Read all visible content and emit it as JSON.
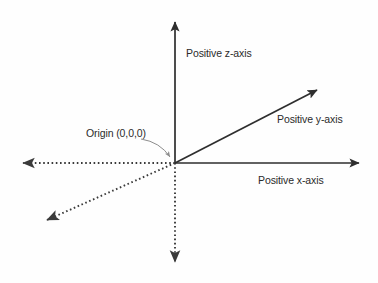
{
  "diagram": {
    "background_color": "#fefefe",
    "solid_axis_color": "#2e2e2e",
    "dotted_axis_color": "#3a3a3a",
    "text_color": "#2b2b2b",
    "origin": {
      "x": 175,
      "y": 163
    },
    "labels": {
      "z_axis": "Positive z-axis",
      "y_axis": "Positive y-axis",
      "x_axis": "Positive x-axis",
      "origin": "Origin (0,0,0)"
    },
    "axes": [
      {
        "name": "positive-z-axis",
        "style": "solid",
        "from": {
          "x": 175,
          "y": 163
        },
        "to": {
          "x": 175,
          "y": 17
        },
        "arrowhead": true
      },
      {
        "name": "negative-z-axis",
        "style": "dotted",
        "from": {
          "x": 175,
          "y": 163
        },
        "to": {
          "x": 175,
          "y": 268
        },
        "arrowhead": true
      },
      {
        "name": "positive-x-axis",
        "style": "solid",
        "from": {
          "x": 175,
          "y": 163
        },
        "to": {
          "x": 365,
          "y": 163
        },
        "arrowhead": true
      },
      {
        "name": "negative-x-axis",
        "style": "dotted",
        "from": {
          "x": 175,
          "y": 163
        },
        "to": {
          "x": 16,
          "y": 163
        },
        "arrowhead": true
      },
      {
        "name": "positive-y-axis",
        "style": "solid",
        "from": {
          "x": 175,
          "y": 163
        },
        "to": {
          "x": 322,
          "y": 87
        },
        "arrowhead": true
      },
      {
        "name": "negative-y-axis",
        "style": "dotted",
        "from": {
          "x": 175,
          "y": 163
        },
        "to": {
          "x": 41,
          "y": 223
        },
        "arrowhead": true
      }
    ],
    "leader_line": {
      "name": "origin-leader-line",
      "from": {
        "x": 141,
        "y": 139
      },
      "to": {
        "x": 172,
        "y": 160
      },
      "arrowhead": true
    }
  }
}
